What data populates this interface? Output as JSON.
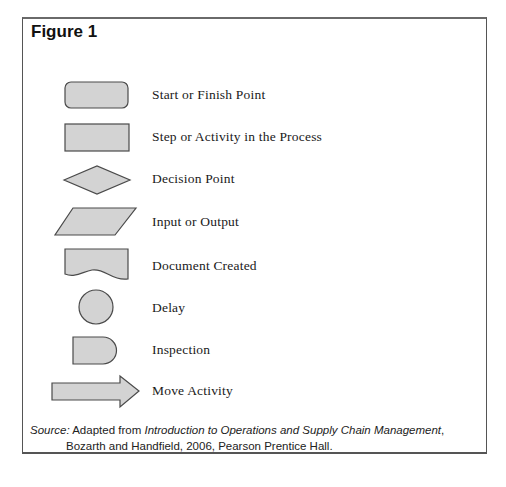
{
  "figure": {
    "title": "Figure 1",
    "colors": {
      "shape_fill": "#d3d3d3",
      "shape_stroke": "#4a4a4a",
      "frame_border": "#555555"
    },
    "legend": [
      {
        "shape": "rounded-rectangle",
        "label": "Start or Finish Point"
      },
      {
        "shape": "rectangle",
        "label": "Step or Activity in the Process"
      },
      {
        "shape": "diamond",
        "label": "Decision Point"
      },
      {
        "shape": "parallelogram",
        "label": "Input or Output"
      },
      {
        "shape": "document",
        "label": "Document Created"
      },
      {
        "shape": "circle",
        "label": "Delay"
      },
      {
        "shape": "d-shape",
        "label": "Inspection"
      },
      {
        "shape": "arrow",
        "label": "Move Activity"
      }
    ],
    "source": {
      "prefix": "Source:",
      "text1": " Adapted from ",
      "book_title": "Introduction to Operations and Supply Chain Management",
      "text2": ",",
      "line2": "Bozarth and Handfield, 2006, Pearson Prentice Hall."
    }
  }
}
